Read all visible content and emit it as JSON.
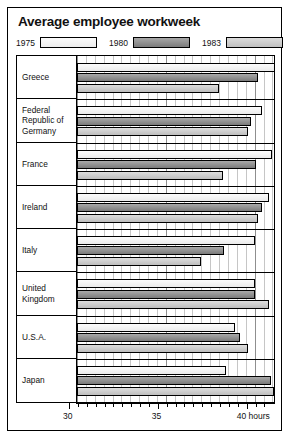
{
  "chart": {
    "title": "Average employee workweek",
    "legend": [
      {
        "label": "1975",
        "key": "y1975",
        "color": "#f2f2f2"
      },
      {
        "label": "1980",
        "key": "y1980",
        "color": "#8d8d8d"
      },
      {
        "label": "1983",
        "key": "y1983",
        "color": "#cccccc"
      }
    ],
    "axis": {
      "labels": [
        "30",
        "35",
        "40 hours"
      ],
      "unit": "hours"
    }
  },
  "chart_data": {
    "type": "bar",
    "orientation": "horizontal",
    "title": "Average employee workweek",
    "xlabel": "40 hours",
    "ylabel": "",
    "xlim": [
      29.5,
      41.2
    ],
    "xticks": [
      30,
      35,
      40
    ],
    "xtick_labels": [
      "30",
      "35",
      "40 hours"
    ],
    "minor_tick_step": 0.5,
    "grid": true,
    "legend_position": "top",
    "categories": [
      "Greece",
      "Federal Republic of Germany",
      "France",
      "Ireland",
      "Italy",
      "United Kingdom",
      "U.S.A.",
      "Japan"
    ],
    "series": [
      {
        "name": "1975",
        "values": [
          41.2,
          40.4,
          41.0,
          40.8,
          40.0,
          40.0,
          38.9,
          38.4
        ]
      },
      {
        "name": "1980",
        "values": [
          40.2,
          39.8,
          40.1,
          40.4,
          38.3,
          40.0,
          39.2,
          40.9
        ]
      },
      {
        "name": "1983",
        "values": [
          38.0,
          39.6,
          38.2,
          40.2,
          37.0,
          40.8,
          39.6,
          41.1
        ]
      }
    ]
  }
}
